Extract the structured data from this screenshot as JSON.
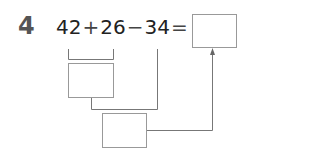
{
  "problem": {
    "number": "4",
    "terms": [
      "42",
      "26",
      "34"
    ],
    "operators": [
      "+",
      "−",
      "="
    ],
    "answer_box": "",
    "step1_box": "",
    "step2_box": ""
  },
  "colors": {
    "line": "#777777",
    "box_border": "#999999",
    "number": "#555555",
    "text": "#222222"
  }
}
